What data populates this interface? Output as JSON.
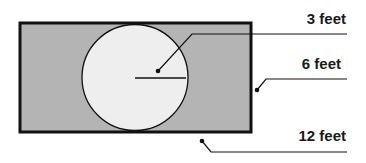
{
  "diagram": {
    "type": "geometry-figure",
    "labels": {
      "radius": "3 feet",
      "width": "6 feet",
      "length": "12 feet"
    },
    "shapes": {
      "rectangle": {
        "length": "12 feet",
        "width": "6 feet"
      },
      "circle": {
        "radius": "3 feet"
      }
    },
    "colors": {
      "rectangle_fill": "#b4b4b4",
      "circle_fill": "#eeeeee",
      "stroke": "#111111"
    }
  }
}
